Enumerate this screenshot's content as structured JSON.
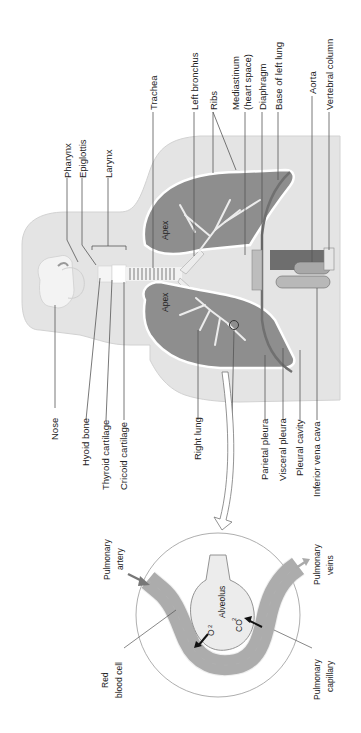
{
  "diagram": {
    "orientation": "rotated 90 degrees counter-clockwise",
    "colors": {
      "body": "#e6e6e6",
      "body_dark": "#d4d4d4",
      "lung": "#8c8c8c",
      "lung_border": "#ffffff",
      "airway": "#f2f2f2",
      "leader": "#555555",
      "capillary": "#9a9a9a",
      "alveolus": "#ececec",
      "text": "#222222"
    },
    "labels_top": [
      {
        "id": "pharynx",
        "text": "Pharynx"
      },
      {
        "id": "epiglottis",
        "text": "Epiglottis"
      },
      {
        "id": "larynx",
        "text": "Larynx"
      },
      {
        "id": "trachea",
        "text": "Trachea"
      },
      {
        "id": "left-bronchus",
        "text": "Left bronchus"
      },
      {
        "id": "ribs",
        "text": "Ribs"
      },
      {
        "id": "mediastinum",
        "text": "Mediastinum"
      },
      {
        "id": "mediastinum-sub",
        "text": "(heart space)"
      },
      {
        "id": "diaphragm",
        "text": "Diaphragm"
      },
      {
        "id": "base-left-lung",
        "text": "Base of left lung"
      },
      {
        "id": "aorta",
        "text": "Aorta"
      },
      {
        "id": "vertebral-column",
        "text": "Vertebral column"
      }
    ],
    "labels_bottom": [
      {
        "id": "nose",
        "text": "Nose"
      },
      {
        "id": "hyoid-bone",
        "text": "Hyoid bone"
      },
      {
        "id": "thyroid-cartilage",
        "text": "Thyroid cartilage"
      },
      {
        "id": "cricoid-cartilage",
        "text": "Cricoid cartilage"
      },
      {
        "id": "right-lung",
        "text": "Right lung"
      },
      {
        "id": "parietal-pleura",
        "text": "Parietal pleura"
      },
      {
        "id": "visceral-pleura",
        "text": "Visceral pleura"
      },
      {
        "id": "pleural-cavity",
        "text": "Pleural cavity"
      },
      {
        "id": "inferior-vena-cava",
        "text": "Inferior vena cava"
      }
    ],
    "lung_labels": {
      "apex_left": "Apex",
      "apex_right": "Apex"
    },
    "inset": {
      "alveolus": "Alveolus",
      "o2": "O",
      "o2_sub": "2",
      "co2": "CO",
      "co2_sub": "2",
      "pulmonary_artery_1": "Pulmonary",
      "pulmonary_artery_2": "artery",
      "pulmonary_veins_1": "Pulmonary",
      "pulmonary_veins_2": "veins",
      "red_blood_cell_1": "Red",
      "red_blood_cell_2": "blood cell",
      "pulmonary_capillary_1": "Pulmonary",
      "pulmonary_capillary_2": "capillary"
    }
  }
}
